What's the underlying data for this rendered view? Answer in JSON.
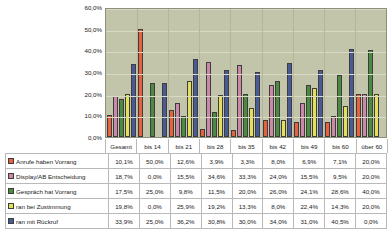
{
  "chart_data": {
    "type": "bar",
    "title": "",
    "xlabel": "",
    "ylabel": "",
    "ylim": [
      0,
      60
    ],
    "grid": true,
    "legend_position": "table-row-headers",
    "categories": [
      "Gesamt",
      "bis 14",
      "bis 21",
      "bis 28",
      "bis 35",
      "bis 42",
      "bis 49",
      "bis 60",
      "über 60"
    ],
    "ytick_labels": [
      "0,0%",
      "10,0%",
      "20,0%",
      "30,0%",
      "40,0%",
      "50,0%",
      "60,0%"
    ],
    "ytick_values": [
      0,
      10,
      20,
      30,
      40,
      50,
      60
    ],
    "series": [
      {
        "name": "Anrufe haben Vorrang",
        "color": "#e8603c",
        "values": [
          10.1,
          50.0,
          12.6,
          3.9,
          3.3,
          8.0,
          6.9,
          7.1,
          20.0
        ],
        "labels": [
          "10,1%",
          "50,0%",
          "12,6%",
          "3,9%",
          "3,3%",
          "8,0%",
          "6,9%",
          "7,1%",
          "20,0%"
        ]
      },
      {
        "name": "Display/AB Entscheidung",
        "color": "#cc88a8",
        "values": [
          18.7,
          0.0,
          15.5,
          34.6,
          33.3,
          24.0,
          15.5,
          9.5,
          20.0
        ],
        "labels": [
          "18,7%",
          "0,0%",
          "15,5%",
          "34,6%",
          "33,3%",
          "24,0%",
          "15,5%",
          "9,5%",
          "20,0%"
        ]
      },
      {
        "name": "Gespräch hat Vorrang",
        "color": "#4a8b3f",
        "values": [
          17.5,
          25.0,
          9.8,
          11.5,
          20.0,
          26.0,
          24.1,
          28.6,
          40.0
        ],
        "labels": [
          "17,5%",
          "25,0%",
          "9,8%",
          "11,5%",
          "20,0%",
          "26,0%",
          "24,1%",
          "28,6%",
          "40,0%"
        ]
      },
      {
        "name": "ran bei Zustimmung",
        "color": "#e2e05a",
        "values": [
          19.8,
          0.0,
          25.9,
          19.2,
          13.3,
          8.0,
          22.4,
          14.3,
          20.0
        ],
        "labels": [
          "19,8%",
          "0,0%",
          "25,9%",
          "19,2%",
          "13,3%",
          "8,0%",
          "22,4%",
          "14,3%",
          "20,0%"
        ]
      },
      {
        "name": "ran mit Rückruf",
        "color": "#4a5a96",
        "values": [
          33.9,
          25.0,
          36.2,
          30.8,
          30.0,
          34.0,
          31.0,
          40.5,
          0.0
        ],
        "labels": [
          "33,9%",
          "25,0%",
          "36,2%",
          "30,8%",
          "30,0%",
          "34,0%",
          "31,0%",
          "40,5%",
          "0,0%"
        ]
      }
    ]
  },
  "colors": {
    "plot_background": "#c3c5ab",
    "gridline": "#d9dac6",
    "plot_border": "#8f907c",
    "table_border": "#b9b9b9",
    "text": "#1a1a1a",
    "page_background": "#ffffff"
  }
}
